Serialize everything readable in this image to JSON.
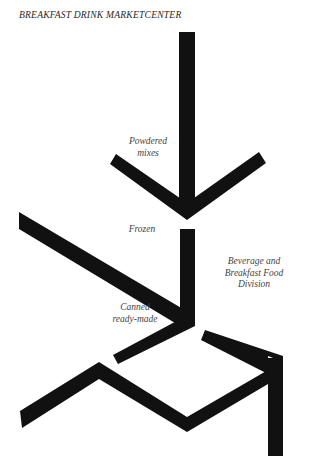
{
  "title": "BREAKFAST DRINK MARKETCENTER",
  "labels": {
    "powdered": {
      "line1": "Powdered",
      "line2": "mixes"
    },
    "frozen": {
      "line1": "Frozen"
    },
    "canned": {
      "line1": "Canned",
      "line2": "ready-made"
    },
    "division": {
      "line1": "Beverage and",
      "line2": "Breakfast Food",
      "line3": "Division"
    }
  },
  "colors": {
    "ink": "#111111",
    "text": "#444444",
    "background": "#ffffff"
  }
}
